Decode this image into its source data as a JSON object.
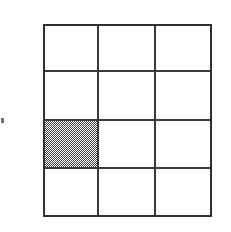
{
  "figure": {
    "background_color": "#ffffff",
    "line_color": "#3a3a3a",
    "shade_color": "#4a4a4a",
    "shade_pattern": "50-percent-checkerboard-dither"
  },
  "grid": {
    "columns": 3,
    "rows": 4,
    "total_cells": 12,
    "shaded_count": 1,
    "unshaded_count": 11,
    "fraction_shaded": "1/12",
    "bounds_px": {
      "left": 43,
      "top": 24,
      "width": 169,
      "height": 193
    },
    "cells": [
      {
        "row": 1,
        "col": 1,
        "shaded": false,
        "label": ""
      },
      {
        "row": 1,
        "col": 2,
        "shaded": false,
        "label": ""
      },
      {
        "row": 1,
        "col": 3,
        "shaded": false,
        "label": ""
      },
      {
        "row": 2,
        "col": 1,
        "shaded": false,
        "label": ""
      },
      {
        "row": 2,
        "col": 2,
        "shaded": false,
        "label": ""
      },
      {
        "row": 2,
        "col": 3,
        "shaded": false,
        "label": ""
      },
      {
        "row": 3,
        "col": 1,
        "shaded": true,
        "label": ""
      },
      {
        "row": 3,
        "col": 2,
        "shaded": false,
        "label": ""
      },
      {
        "row": 3,
        "col": 3,
        "shaded": false,
        "label": ""
      },
      {
        "row": 4,
        "col": 1,
        "shaded": false,
        "label": ""
      },
      {
        "row": 4,
        "col": 2,
        "shaded": false,
        "label": ""
      },
      {
        "row": 4,
        "col": 3,
        "shaded": false,
        "label": ""
      }
    ]
  },
  "artifact": {
    "present": true,
    "note": ""
  }
}
